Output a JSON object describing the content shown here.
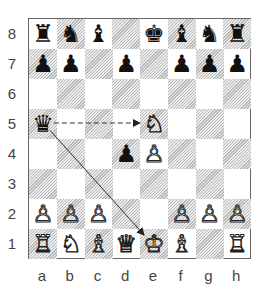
{
  "board": {
    "files": [
      "a",
      "b",
      "c",
      "d",
      "e",
      "f",
      "g",
      "h"
    ],
    "ranks": [
      "8",
      "7",
      "6",
      "5",
      "4",
      "3",
      "2",
      "1"
    ],
    "light_color": "#ffffff",
    "dark_color": "#d0d0d0",
    "pieces": [
      {
        "square": "a8",
        "color": "black",
        "type": "rook",
        "glyph": "♜"
      },
      {
        "square": "b8",
        "color": "black",
        "type": "knight",
        "glyph": "♞"
      },
      {
        "square": "c8",
        "color": "black",
        "type": "bishop",
        "glyph": "♝"
      },
      {
        "square": "e8",
        "color": "black",
        "type": "king",
        "glyph": "♚"
      },
      {
        "square": "f8",
        "color": "black",
        "type": "bishop",
        "glyph": "♝"
      },
      {
        "square": "g8",
        "color": "black",
        "type": "knight",
        "glyph": "♞"
      },
      {
        "square": "h8",
        "color": "black",
        "type": "rook",
        "glyph": "♜"
      },
      {
        "square": "a7",
        "color": "black",
        "type": "pawn",
        "glyph": "♟"
      },
      {
        "square": "b7",
        "color": "black",
        "type": "pawn",
        "glyph": "♟"
      },
      {
        "square": "d7",
        "color": "black",
        "type": "pawn",
        "glyph": "♟"
      },
      {
        "square": "f7",
        "color": "black",
        "type": "pawn",
        "glyph": "♟"
      },
      {
        "square": "g7",
        "color": "black",
        "type": "pawn",
        "glyph": "♟"
      },
      {
        "square": "h7",
        "color": "black",
        "type": "pawn",
        "glyph": "♟"
      },
      {
        "square": "a5",
        "color": "black",
        "type": "queen",
        "glyph": "♛"
      },
      {
        "square": "e5",
        "color": "white",
        "type": "knight",
        "glyph": "♘"
      },
      {
        "square": "d4",
        "color": "black",
        "type": "pawn",
        "glyph": "♟"
      },
      {
        "square": "e4",
        "color": "white",
        "type": "pawn",
        "glyph": "♙"
      },
      {
        "square": "a2",
        "color": "white",
        "type": "pawn",
        "glyph": "♙"
      },
      {
        "square": "b2",
        "color": "white",
        "type": "pawn",
        "glyph": "♙"
      },
      {
        "square": "c2",
        "color": "white",
        "type": "pawn",
        "glyph": "♙"
      },
      {
        "square": "f2",
        "color": "white",
        "type": "pawn",
        "glyph": "♙"
      },
      {
        "square": "g2",
        "color": "white",
        "type": "pawn",
        "glyph": "♙"
      },
      {
        "square": "h2",
        "color": "white",
        "type": "pawn",
        "glyph": "♙"
      },
      {
        "square": "a1",
        "color": "white",
        "type": "rook",
        "glyph": "♖"
      },
      {
        "square": "b1",
        "color": "white",
        "type": "knight",
        "glyph": "♘"
      },
      {
        "square": "c1",
        "color": "white",
        "type": "bishop",
        "glyph": "♗"
      },
      {
        "square": "d1",
        "color": "white",
        "type": "queen",
        "glyph": "♕"
      },
      {
        "square": "e1",
        "color": "white",
        "type": "king",
        "glyph": "♔"
      },
      {
        "square": "f1",
        "color": "white",
        "type": "bishop",
        "glyph": "♗"
      },
      {
        "square": "h1",
        "color": "white",
        "type": "rook",
        "glyph": "♖"
      }
    ],
    "arrows": [
      {
        "from": "a5",
        "to": "e5",
        "style": "dashed"
      },
      {
        "from": "a5",
        "to": "e1",
        "style": "solid"
      }
    ]
  }
}
